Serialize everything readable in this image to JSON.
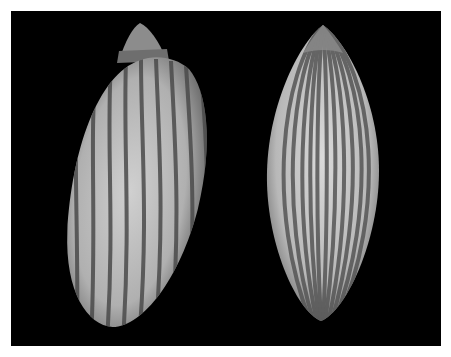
{
  "image": {
    "description": "Two striped gastropod shells photographed on a black background",
    "background_color": "#000000",
    "border_color": "#ffffff",
    "subjects": [
      {
        "name": "left-shell",
        "view": "tilted, spire at top",
        "stripe_count_visible": 9
      },
      {
        "name": "right-shell",
        "view": "upright, pointed apex",
        "stripe_count_visible": 11
      }
    ],
    "colors": {
      "shell_light": "#c8c8c8",
      "shell_mid": "#9a9a9a",
      "stripe": "#555555"
    }
  }
}
